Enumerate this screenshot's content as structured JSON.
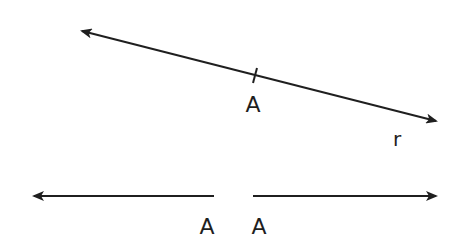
{
  "diagram": {
    "line_r": {
      "label": "r",
      "point_label": "A",
      "start": [
        80,
        30
      ],
      "end": [
        438,
        121
      ],
      "tick_point": [
        255,
        75
      ]
    },
    "split_rays": {
      "left_ray": {
        "start": [
          214,
          196
        ],
        "end": [
          32,
          196
        ],
        "label": "A"
      },
      "right_ray": {
        "start": [
          253,
          196
        ],
        "end": [
          438,
          196
        ],
        "label": "A"
      }
    },
    "colors": {
      "stroke": "#1f1f1f",
      "background": "#ffffff"
    }
  }
}
